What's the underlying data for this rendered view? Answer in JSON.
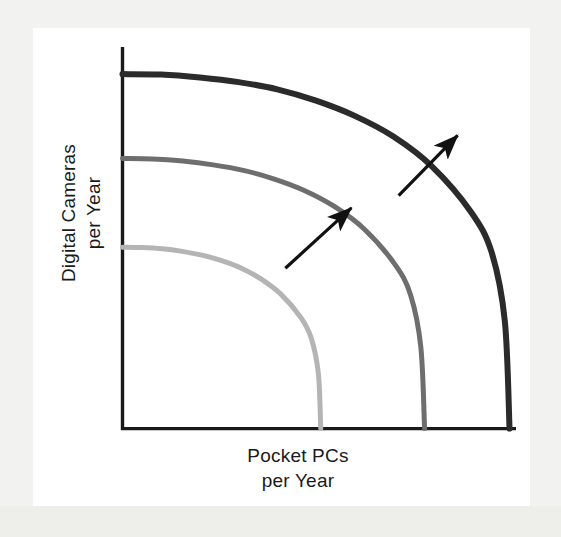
{
  "figure": {
    "kind": "production-possibilities-frontier",
    "background_color": "#f2f2f0",
    "page_color": "#ffffff"
  },
  "axes": {
    "y_label_line1": "Digital Cameras",
    "y_label_line2": "per Year",
    "x_label_line1": "Pocket PCs",
    "x_label_line2": "per Year",
    "axis_color": "#1a1a1a"
  },
  "annotations": {
    "arrow_1_name": "growth-arrow-inner",
    "arrow_2_name": "growth-arrow-outer",
    "arrow_color": "#111111"
  },
  "chart_data": {
    "type": "line",
    "title": "",
    "subtitle": "",
    "xlabel": "Pocket PCs per Year",
    "ylabel": "Digital Cameras per Year",
    "xlim": [
      0,
      100
    ],
    "ylim": [
      0,
      100
    ],
    "grid": false,
    "legend": "none",
    "axis_ticks": {
      "x": [],
      "y": []
    },
    "series": [
      {
        "name": "PPF 1 (initial)",
        "color": "#b4b4b4",
        "stroke_width": 5,
        "x_intercept": 42,
        "y_intercept": 43,
        "points": [
          {
            "x": 0,
            "y": 43.0
          },
          {
            "x": 4.2,
            "y": 42.9
          },
          {
            "x": 8.4,
            "y": 42.6
          },
          {
            "x": 12.6,
            "y": 42.0
          },
          {
            "x": 16.8,
            "y": 41.1
          },
          {
            "x": 21.0,
            "y": 39.8
          },
          {
            "x": 25.2,
            "y": 38.0
          },
          {
            "x": 29.4,
            "y": 35.4
          },
          {
            "x": 33.6,
            "y": 31.8
          },
          {
            "x": 37.8,
            "y": 26.3
          },
          {
            "x": 40.0,
            "y": 21.4
          },
          {
            "x": 41.5,
            "y": 13.0
          },
          {
            "x": 42.0,
            "y": 0.0
          }
        ]
      },
      {
        "name": "PPF 2 (after growth)",
        "color": "#6e6e6e",
        "stroke_width": 5,
        "x_intercept": 64,
        "y_intercept": 64,
        "points": [
          {
            "x": 0,
            "y": 64.0
          },
          {
            "x": 6.4,
            "y": 63.9
          },
          {
            "x": 12.8,
            "y": 63.4
          },
          {
            "x": 19.2,
            "y": 62.5
          },
          {
            "x": 25.6,
            "y": 61.2
          },
          {
            "x": 32.0,
            "y": 59.2
          },
          {
            "x": 38.4,
            "y": 56.5
          },
          {
            "x": 44.8,
            "y": 52.7
          },
          {
            "x": 51.2,
            "y": 47.3
          },
          {
            "x": 57.6,
            "y": 39.1
          },
          {
            "x": 61.0,
            "y": 31.8
          },
          {
            "x": 63.2,
            "y": 19.4
          },
          {
            "x": 64.0,
            "y": 0.0
          }
        ]
      },
      {
        "name": "PPF 3 (after further growth)",
        "color": "#2b2b2b",
        "stroke_width": 6,
        "x_intercept": 82,
        "y_intercept": 84,
        "points": [
          {
            "x": 0,
            "y": 84.0
          },
          {
            "x": 8.2,
            "y": 83.9
          },
          {
            "x": 16.4,
            "y": 83.2
          },
          {
            "x": 24.6,
            "y": 82.1
          },
          {
            "x": 32.8,
            "y": 80.4
          },
          {
            "x": 41.0,
            "y": 77.7
          },
          {
            "x": 49.2,
            "y": 74.1
          },
          {
            "x": 57.4,
            "y": 69.2
          },
          {
            "x": 65.6,
            "y": 62.1
          },
          {
            "x": 73.8,
            "y": 51.4
          },
          {
            "x": 78.2,
            "y": 41.8
          },
          {
            "x": 81.0,
            "y": 25.5
          },
          {
            "x": 82.0,
            "y": 0.0
          }
        ]
      }
    ],
    "arrows": [
      {
        "name": "growth-arrow-inner",
        "from": {
          "x": 34.5,
          "y": 38.0
        },
        "to": {
          "x": 48.5,
          "y": 52.3
        },
        "direction": "up-right"
      },
      {
        "name": "growth-arrow-outer",
        "from": {
          "x": 58.5,
          "y": 55.2
        },
        "to": {
          "x": 71.0,
          "y": 69.5
        },
        "direction": "up-right"
      }
    ]
  }
}
